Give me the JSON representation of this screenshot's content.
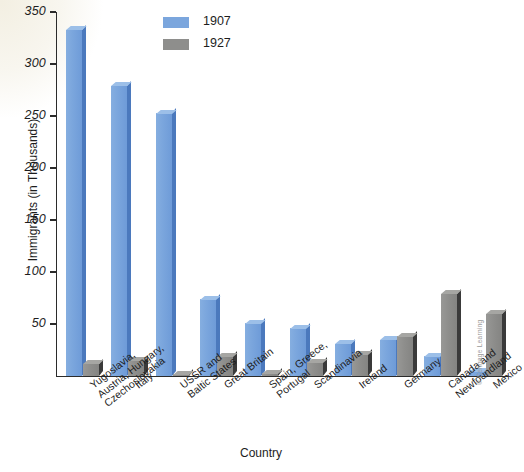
{
  "chart_data": {
    "type": "bar",
    "title": "",
    "xlabel": "Country",
    "ylabel": "Immigrants (in Thousands)",
    "ylim": [
      0,
      350
    ],
    "yticks": [
      50,
      100,
      150,
      200,
      250,
      300,
      350
    ],
    "ytick_labels": [
      "50",
      "100",
      "150",
      "200",
      "250",
      "300",
      "350"
    ],
    "grid": false,
    "legend_position": "top-center",
    "categories": [
      "Yugoslavia,\nAustria, Hungary,\nCzechoslovakia",
      "Italy",
      "USSR and\nBaltic States",
      "Great Britain",
      "Spain, Greece,\nPortugal",
      "Scandinavia",
      "Ireland",
      "Germany",
      "Canada and\nNewfoundland",
      "Mexico"
    ],
    "series": [
      {
        "name": "1907",
        "color": "#7ba6dd",
        "values": [
          333,
          279,
          253,
          74,
          51,
          46,
          31,
          35,
          19,
          4
        ]
      },
      {
        "name": "1927",
        "color": "#8e8e8c",
        "values": [
          12,
          15,
          2,
          19,
          3,
          13,
          21,
          38,
          79,
          60
        ]
      }
    ]
  },
  "legend": {
    "items": [
      {
        "label": "1907",
        "swatch": "legend-swatch-1907"
      },
      {
        "label": "1927",
        "swatch": "legend-swatch-1927"
      }
    ]
  },
  "axes": {
    "y_title": "Immigrants (in Thousands)",
    "x_title": "Country"
  },
  "credit": "© Cengage Learning"
}
